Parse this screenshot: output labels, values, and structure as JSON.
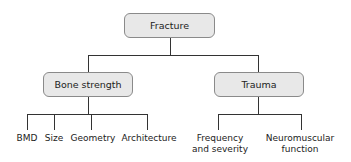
{
  "diagram": {
    "root": {
      "label": "Fracture"
    },
    "branches": [
      {
        "label": "Bone strength",
        "children": [
          "BMD",
          "Size",
          "Geometry",
          "Architecture"
        ]
      },
      {
        "label": "Trauma",
        "children": [
          {
            "line1": "Frequency",
            "line2": "and severity"
          },
          {
            "line1": "Neuromuscular",
            "line2": "function"
          }
        ]
      }
    ],
    "colors": {
      "box_fill": "#e8e8e8",
      "box_border": "#8a8a8a",
      "line": "#333333"
    }
  }
}
